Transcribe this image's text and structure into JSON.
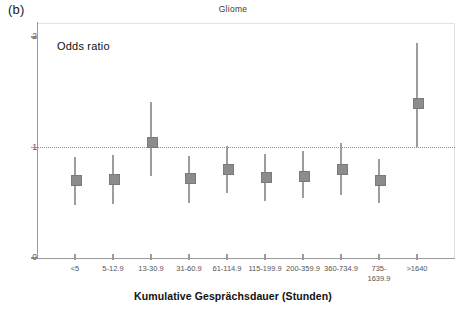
{
  "panel": {
    "label": "(b)"
  },
  "annotations": {
    "odds_ratio": "Odds ratio"
  },
  "chart_data": {
    "type": "scatter",
    "title": "Gliome",
    "xlabel": "Kumulative Gesprächsdauer (Stunden)",
    "ylabel": "Odds ratio",
    "categories": [
      "<5",
      "5-12.9",
      "13-30.9",
      "31-60.9",
      "61-114.9",
      "115-199.9",
      "200-359.9",
      "360-734.9",
      "735-\n1639.9",
      ">1640"
    ],
    "values": [
      0.71,
      0.72,
      1.05,
      0.73,
      0.81,
      0.74,
      0.75,
      0.81,
      0.71,
      1.41
    ],
    "ci_low": [
      0.48,
      0.49,
      0.74,
      0.5,
      0.59,
      0.52,
      0.54,
      0.57,
      0.5,
      1.0
    ],
    "ci_high": [
      0.91,
      0.93,
      1.41,
      0.92,
      1.01,
      0.94,
      0.97,
      1.04,
      0.9,
      1.95
    ],
    "ylim": [
      0,
      2
    ],
    "yticks": [
      "0",
      "1",
      "2"
    ],
    "reference_line": 1,
    "grid": false,
    "legend": "none",
    "marker_color": "#8c8c8c",
    "line_color": "#9d9d9d",
    "axis_color": "#9a9a9a"
  }
}
